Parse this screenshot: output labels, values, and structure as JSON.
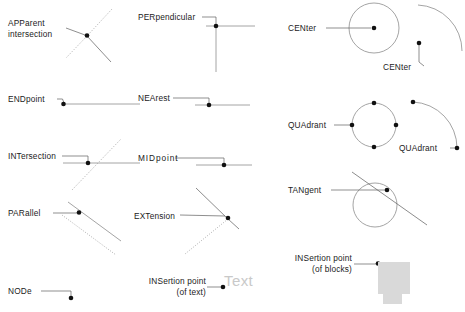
{
  "page": {
    "background_color": "#ffffff",
    "line_color": "#8d8d8d",
    "point_color": "#121212",
    "text_color": "#1b1b1b",
    "block_color": "#d9d9d9",
    "sample_text_color": "#c9c9c9"
  },
  "columns": [
    {
      "name": "column-left",
      "entries": [
        {
          "id": "apparent-intersection",
          "label_line1": "APParent",
          "label_line2": "intersection",
          "snap_code": "APP",
          "geometry": "two lines crossing at an apparent intersection point"
        },
        {
          "id": "endpoint",
          "label_line1": "ENDpoint",
          "label_line2": "",
          "snap_code": "END",
          "geometry": "horizontal line with marker at its left endpoint"
        },
        {
          "id": "intersection",
          "label_line1": "INTersection",
          "label_line2": "",
          "snap_code": "INT",
          "geometry": "horizontal line crossed by a diagonal line"
        },
        {
          "id": "parallel",
          "label_line1": "PARallel",
          "label_line2": "",
          "snap_code": "PAR",
          "geometry": "two parallel diagonal lines with marker on the upper one"
        },
        {
          "id": "node",
          "label_line1": "NODe",
          "label_line2": "",
          "snap_code": "NOD",
          "geometry": "single point node"
        }
      ]
    },
    {
      "name": "column-middle",
      "entries": [
        {
          "id": "perpendicular",
          "label_line1": "PERpendicular",
          "label_line2": "",
          "snap_code": "PER",
          "geometry": "vertical line meeting a horizontal line at right angle"
        },
        {
          "id": "nearest",
          "label_line1": "NEArest",
          "label_line2": "",
          "snap_code": "NEA",
          "geometry": "marker on an arbitrary point along a horizontal line"
        },
        {
          "id": "midpoint",
          "label_line1": "MIDpoint",
          "label_line2": "",
          "snap_code": "MID",
          "geometry": "marker at the middle of a horizontal line"
        },
        {
          "id": "extension",
          "label_line1": "EXTension",
          "label_line2": "",
          "snap_code": "EXT",
          "geometry": "dotted extension path beyond the end of a line"
        },
        {
          "id": "insertion-point-text",
          "label_line1": "INSertion point",
          "label_line2": "(of text)",
          "snap_code": "INS",
          "geometry": "marker at the insertion point of a text object",
          "sample_text": "Text"
        }
      ]
    },
    {
      "name": "column-right",
      "entries": [
        {
          "id": "center-circle",
          "label_line1": "CENter",
          "label_line2": "",
          "snap_code": "CEN",
          "geometry": "marker at the centre of a circle"
        },
        {
          "id": "center-arc",
          "label_line1": "CENter",
          "label_line2": "",
          "snap_code": "CEN",
          "geometry": "marker at the centre of an arc"
        },
        {
          "id": "quadrant-circle",
          "label_line1": "QUAdrant",
          "label_line2": "",
          "snap_code": "QUA",
          "geometry": "four quadrant markers around a circle"
        },
        {
          "id": "quadrant-arc",
          "label_line1": "QUAdrant",
          "label_line2": "",
          "snap_code": "QUA",
          "geometry": "quadrant markers at the ends of an arc"
        },
        {
          "id": "tangent",
          "label_line1": "TANgent",
          "label_line2": "",
          "snap_code": "TAN",
          "geometry": "marker where a straight line touches a circle tangentially"
        },
        {
          "id": "insertion-point-blocks",
          "label_line1": "INSertion point",
          "label_line2": "(of blocks)",
          "snap_code": "INS",
          "geometry": "marker at the insertion point of a grey block symbol"
        }
      ]
    }
  ]
}
